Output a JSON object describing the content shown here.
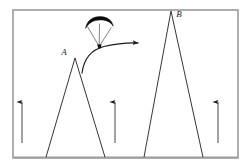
{
  "figure": {
    "background_color": "#ffffff",
    "frame": {
      "color": "#9a9a9a",
      "x": 13,
      "y": 10,
      "width": 225,
      "height": 148,
      "stroke_width": 1.6
    },
    "labels": {
      "peak_a": "A",
      "peak_b": "B"
    },
    "peaks": [
      {
        "name": "peak-a",
        "label": "A",
        "apex_x": 75,
        "apex_y": 58,
        "base_left_x": 46,
        "base_right_x": 105,
        "base_y": 157,
        "label_x": 66,
        "label_y": 54,
        "stroke": "#2b2b2b"
      },
      {
        "name": "peak-b",
        "label": "B",
        "apex_x": 171,
        "apex_y": 11,
        "base_left_x": 144,
        "base_right_x": 203,
        "base_y": 157,
        "label_x": 178,
        "label_y": 16,
        "stroke": "#2b2b2b"
      }
    ],
    "paraglider": {
      "canopy_color": "#0d0d0d",
      "line_color": "#4a4a4a",
      "harness_color": "#0d0d0d",
      "canopy_left_x": 86,
      "canopy_right_x": 113,
      "canopy_top_y": 19,
      "harness_x": 99,
      "harness_y": 46
    },
    "trajectory": {
      "name": "flight-path-arrow",
      "color": "#1a1a1a",
      "start_x": 82,
      "start_y": 73,
      "end_x": 141,
      "end_y": 43,
      "stroke_width": 1.1,
      "arrowhead": true
    },
    "updraft_arrows": [
      {
        "name": "updraft-arrow-left",
        "x": 22,
        "tail_y": 143,
        "head_y": 100
      },
      {
        "name": "updraft-arrow-middle",
        "x": 115,
        "tail_y": 143,
        "head_y": 100
      },
      {
        "name": "updraft-arrow-right",
        "x": 218,
        "tail_y": 143,
        "head_y": 100
      }
    ],
    "updraft_arrow_color": "#1a1a1a"
  }
}
